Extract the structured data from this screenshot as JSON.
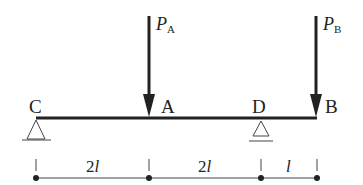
{
  "diagram": {
    "type": "beam",
    "points": {
      "C": {
        "label": "C",
        "support": "pin"
      },
      "A": {
        "label": "A"
      },
      "D": {
        "label": "D",
        "support": "roller"
      },
      "B": {
        "label": "B"
      }
    },
    "forces": [
      {
        "label": "P",
        "sub": "A",
        "at": "A",
        "direction": "down"
      },
      {
        "label": "P",
        "sub": "B",
        "at": "B",
        "direction": "down"
      }
    ],
    "dimensions": [
      {
        "from": "C",
        "to": "A",
        "label_num": "2",
        "label_var": "l"
      },
      {
        "from": "A",
        "to": "D",
        "label_num": "2",
        "label_var": "l"
      },
      {
        "from": "D",
        "to": "B",
        "label_num": "",
        "label_var": "l"
      }
    ],
    "colors": {
      "line": "#222222",
      "thin": "#444444"
    }
  }
}
